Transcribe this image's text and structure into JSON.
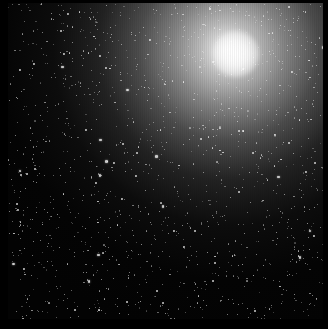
{
  "image": {
    "subject": "galaxy core with surrounding star field",
    "palette": {
      "background": "#000000",
      "core": "#ffffff",
      "halo_mid": "#bebebe",
      "halo_outer": "#373737"
    },
    "core_position_px": [
      228,
      50
    ],
    "border_px": {
      "left": 8,
      "top": 3,
      "right": 5,
      "bottom": 10
    }
  }
}
